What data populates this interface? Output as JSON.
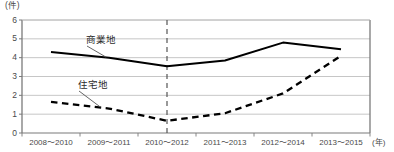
{
  "chart_data": {
    "type": "line",
    "title": "",
    "subtitle": "",
    "xlabel": "(年)",
    "ylabel": "(件)",
    "y_unit": "(件)",
    "x_unit": "(年)",
    "categories": [
      "2008～2010",
      "2009～2011",
      "2010～2012",
      "2011～2013",
      "2012～2014",
      "2013～2015"
    ],
    "ylim": [
      0,
      6
    ],
    "y_ticks": [
      "0",
      "1",
      "2",
      "3",
      "4",
      "5",
      "6"
    ],
    "y_tick_values": [
      0,
      1,
      2,
      3,
      4,
      5,
      6
    ],
    "grid": true,
    "grid_axis": "y",
    "legend": "inline-labels",
    "series": [
      {
        "name": "商業地",
        "label": "商業地",
        "style": "solid",
        "color": "#000000",
        "values": [
          4.3,
          4.0,
          3.55,
          3.85,
          4.8,
          4.45
        ]
      },
      {
        "name": "住宅地",
        "label": "住宅地",
        "style": "dashed",
        "color": "#000000",
        "values": [
          1.65,
          1.3,
          0.65,
          1.05,
          2.1,
          4.1
        ]
      }
    ],
    "annotations": [
      {
        "name": "vertical-reference-line",
        "style": "dashed",
        "orientation": "vertical",
        "at_category": "2010～2012",
        "color": "#555555"
      }
    ]
  },
  "labels": {
    "unit_y": "(件)",
    "unit_x": "(年)",
    "series_commercial": "商業地",
    "series_residential": "住宅地"
  },
  "colors": {
    "axis": "#7a7a7a",
    "grid": "#b8b8b8",
    "line": "#000000",
    "dashed_marker": "#555555",
    "text": "#4a4a4a"
  }
}
